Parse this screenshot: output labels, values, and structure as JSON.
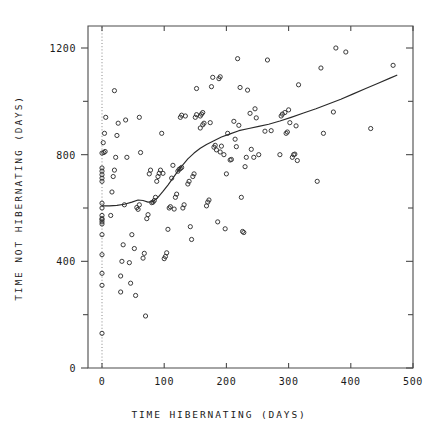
{
  "chart_data": {
    "type": "scatter",
    "title": "",
    "xlabel": "TIME HIBERNATING (DAYS)",
    "ylabel": "TIME NOT HIBERNATING (DAYS)",
    "xlim": [
      -25,
      500
    ],
    "ylim": [
      0,
      1290
    ],
    "xticks": [
      0,
      100,
      200,
      300,
      400,
      500
    ],
    "xticklabels": [
      "0",
      "100",
      "200",
      "300",
      "400",
      "500"
    ],
    "yticks": [
      0,
      200,
      400,
      600,
      800,
      1000,
      1200
    ],
    "yticklabels": [
      "0",
      "",
      "400",
      "",
      "800",
      "",
      "1200"
    ],
    "grid": false,
    "legend": null,
    "marker": "open-circle",
    "reference_lines": [
      {
        "name": "zero-vertical-dotted",
        "orientation": "vertical",
        "x": 0,
        "style": "dotted"
      }
    ],
    "series": [
      {
        "name": "observations",
        "type": "scatter",
        "points": [
          [
            0,
            130
          ],
          [
            0,
            310
          ],
          [
            0,
            355
          ],
          [
            0,
            425
          ],
          [
            0,
            500
          ],
          [
            0,
            540
          ],
          [
            0,
            548
          ],
          [
            0,
            556
          ],
          [
            0,
            560
          ],
          [
            0,
            572
          ],
          [
            0,
            600
          ],
          [
            0,
            618
          ],
          [
            0,
            700
          ],
          [
            0,
            712
          ],
          [
            0,
            725
          ],
          [
            0,
            738
          ],
          [
            0,
            750
          ],
          [
            0,
            806
          ],
          [
            3,
            808
          ],
          [
            5,
            812
          ],
          [
            2,
            845
          ],
          [
            4,
            880
          ],
          [
            6,
            940
          ],
          [
            14,
            572
          ],
          [
            16,
            660
          ],
          [
            18,
            718
          ],
          [
            20,
            742
          ],
          [
            22,
            790
          ],
          [
            24,
            872
          ],
          [
            26,
            918
          ],
          [
            20,
            1040
          ],
          [
            30,
            345
          ],
          [
            32,
            400
          ],
          [
            34,
            462
          ],
          [
            30,
            285
          ],
          [
            36,
            612
          ],
          [
            38,
            930
          ],
          [
            40,
            790
          ],
          [
            44,
            395
          ],
          [
            46,
            318
          ],
          [
            48,
            500
          ],
          [
            52,
            448
          ],
          [
            54,
            272
          ],
          [
            56,
            602
          ],
          [
            58,
            595
          ],
          [
            60,
            612
          ],
          [
            62,
            808
          ],
          [
            60,
            940
          ],
          [
            66,
            412
          ],
          [
            68,
            430
          ],
          [
            70,
            195
          ],
          [
            72,
            560
          ],
          [
            74,
            575
          ],
          [
            76,
            728
          ],
          [
            78,
            742
          ],
          [
            80,
            620
          ],
          [
            82,
            622
          ],
          [
            84,
            628
          ],
          [
            86,
            640
          ],
          [
            88,
            700
          ],
          [
            90,
            718
          ],
          [
            92,
            730
          ],
          [
            94,
            742
          ],
          [
            96,
            880
          ],
          [
            98,
            730
          ],
          [
            100,
            410
          ],
          [
            102,
            418
          ],
          [
            104,
            432
          ],
          [
            106,
            520
          ],
          [
            108,
            600
          ],
          [
            110,
            605
          ],
          [
            112,
            712
          ],
          [
            114,
            760
          ],
          [
            116,
            596
          ],
          [
            118,
            640
          ],
          [
            120,
            652
          ],
          [
            122,
            738
          ],
          [
            124,
            745
          ],
          [
            126,
            748
          ],
          [
            128,
            752
          ],
          [
            130,
            600
          ],
          [
            132,
            612
          ],
          [
            126,
            940
          ],
          [
            128,
            948
          ],
          [
            134,
            945
          ],
          [
            138,
            690
          ],
          [
            140,
            700
          ],
          [
            142,
            530
          ],
          [
            144,
            482
          ],
          [
            146,
            718
          ],
          [
            148,
            728
          ],
          [
            150,
            940
          ],
          [
            152,
            950
          ],
          [
            152,
            1048
          ],
          [
            158,
            945
          ],
          [
            160,
            952
          ],
          [
            162,
            958
          ],
          [
            158,
            900
          ],
          [
            162,
            912
          ],
          [
            164,
            918
          ],
          [
            168,
            608
          ],
          [
            170,
            622
          ],
          [
            172,
            630
          ],
          [
            174,
            920
          ],
          [
            176,
            1055
          ],
          [
            178,
            1090
          ],
          [
            180,
            828
          ],
          [
            182,
            835
          ],
          [
            184,
            818
          ],
          [
            186,
            548
          ],
          [
            188,
            1085
          ],
          [
            190,
            1092
          ],
          [
            190,
            810
          ],
          [
            192,
            832
          ],
          [
            196,
            800
          ],
          [
            198,
            522
          ],
          [
            200,
            728
          ],
          [
            202,
            880
          ],
          [
            206,
            780
          ],
          [
            208,
            782
          ],
          [
            212,
            925
          ],
          [
            214,
            858
          ],
          [
            216,
            830
          ],
          [
            218,
            1160
          ],
          [
            220,
            910
          ],
          [
            222,
            1052
          ],
          [
            224,
            640
          ],
          [
            226,
            512
          ],
          [
            228,
            508
          ],
          [
            230,
            755
          ],
          [
            232,
            790
          ],
          [
            234,
            1042
          ],
          [
            238,
            955
          ],
          [
            240,
            820
          ],
          [
            244,
            790
          ],
          [
            246,
            972
          ],
          [
            248,
            938
          ],
          [
            252,
            800
          ],
          [
            262,
            888
          ],
          [
            266,
            1155
          ],
          [
            272,
            890
          ],
          [
            286,
            800
          ],
          [
            288,
            945
          ],
          [
            290,
            952
          ],
          [
            294,
            958
          ],
          [
            296,
            880
          ],
          [
            298,
            885
          ],
          [
            300,
            968
          ],
          [
            302,
            920
          ],
          [
            306,
            790
          ],
          [
            308,
            800
          ],
          [
            310,
            802
          ],
          [
            312,
            908
          ],
          [
            314,
            778
          ],
          [
            316,
            1062
          ],
          [
            346,
            700
          ],
          [
            352,
            1125
          ],
          [
            356,
            880
          ],
          [
            372,
            960
          ],
          [
            376,
            1200
          ],
          [
            392,
            1185
          ],
          [
            432,
            898
          ],
          [
            468,
            1135
          ]
        ]
      },
      {
        "name": "smoothed-trend",
        "type": "line",
        "points": [
          [
            0,
            608
          ],
          [
            12,
            608
          ],
          [
            24,
            610
          ],
          [
            36,
            614
          ],
          [
            48,
            622
          ],
          [
            58,
            630
          ],
          [
            66,
            628
          ],
          [
            74,
            622
          ],
          [
            82,
            624
          ],
          [
            90,
            640
          ],
          [
            98,
            662
          ],
          [
            106,
            686
          ],
          [
            114,
            712
          ],
          [
            122,
            738
          ],
          [
            130,
            762
          ],
          [
            138,
            784
          ],
          [
            148,
            806
          ],
          [
            158,
            824
          ],
          [
            168,
            838
          ],
          [
            180,
            852
          ],
          [
            192,
            866
          ],
          [
            206,
            878
          ],
          [
            220,
            890
          ],
          [
            236,
            898
          ],
          [
            252,
            906
          ],
          [
            268,
            914
          ],
          [
            286,
            926
          ],
          [
            304,
            940
          ],
          [
            324,
            956
          ],
          [
            344,
            972
          ],
          [
            364,
            990
          ],
          [
            384,
            1008
          ],
          [
            404,
            1028
          ],
          [
            424,
            1048
          ],
          [
            444,
            1068
          ],
          [
            464,
            1088
          ],
          [
            474,
            1098
          ]
        ]
      }
    ]
  },
  "figure": {
    "background_color": "#ffffff",
    "axis_color": "#4a4a4a",
    "marker_color": "#303030",
    "trend_color": "#2a2a2a"
  }
}
